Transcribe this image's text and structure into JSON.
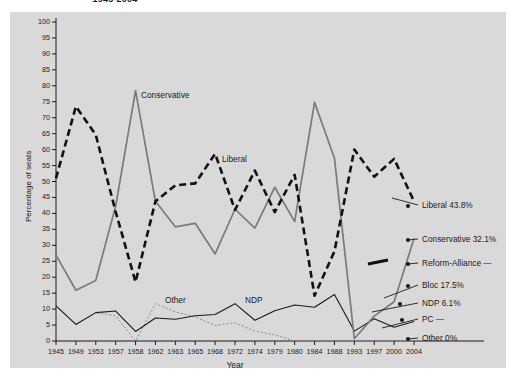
{
  "title": "1945-2004",
  "chart_data": {
    "type": "line",
    "title": "1945-2004",
    "xlabel": "Year",
    "ylabel": "Percentage of seats",
    "ylim": [
      0,
      100
    ],
    "ytick_step": 5,
    "grid": false,
    "legend_position": "right",
    "categories": [
      "1945",
      "1949",
      "1953",
      "1957",
      "1958",
      "1962",
      "1963",
      "1965",
      "1968",
      "1972",
      "1974",
      "1979",
      "1980",
      "1984",
      "1988",
      "1993",
      "1997",
      "2000",
      "2004"
    ],
    "series": [
      {
        "name": "Liberal",
        "style": "dashed-thick-black",
        "color": "#111111",
        "values": [
          51,
          73.5,
          64.6,
          40.5,
          18.5,
          43.8,
          48.8,
          49.4,
          58.7,
          41.1,
          53.4,
          40.4,
          52.1,
          14.2,
          28.1,
          60,
          51.5,
          57.1,
          43.8
        ]
      },
      {
        "name": "Conservative",
        "style": "solid-gray",
        "color": "#7a7a7a",
        "values": [
          26.9,
          15.9,
          19,
          42.3,
          78.5,
          43.8,
          35.8,
          36.9,
          27.3,
          41.3,
          35.4,
          48.2,
          37.4,
          74.8,
          57.3,
          0.7,
          7.8,
          12.3,
          32.1
        ]
      },
      {
        "name": "NDP",
        "style": "solid-thin-black",
        "color": "#1a1a1a",
        "values": [
          11,
          5.2,
          8.9,
          9.4,
          3,
          7.2,
          6.8,
          7.9,
          8.3,
          11.7,
          605,
          9.5,
          11.3,
          10.6,
          14.6,
          3.1,
          7,
          4.3,
          6.1
        ]
      },
      {
        "name": "Other",
        "style": "dotted-thin-gray",
        "color": "#8a8a8a",
        "values": [
          11,
          5.2,
          8.9,
          7.9,
          0,
          11.7,
          9.1,
          7.6,
          4.9,
          5.7,
          3.1,
          1.9,
          0,
          0,
          0,
          0,
          0,
          0,
          0
        ]
      }
    ],
    "annotations": [
      {
        "text": "Conservative",
        "x": 1958
      },
      {
        "text": "Liberal",
        "x": 1968
      },
      {
        "text": "Other",
        "x": 1963
      },
      {
        "text": "NDP",
        "x": 1972
      }
    ],
    "legend_entries": [
      {
        "label": "Liberal 43.8%",
        "value": 43.8
      },
      {
        "label": "Conservative 32.1%",
        "value": 32.1
      },
      {
        "label": "Reform-Alliance —",
        "value": null
      },
      {
        "label": "Bloc 17.5%",
        "value": 17.5
      },
      {
        "label": "NDP 6.1%",
        "value": 6.1
      },
      {
        "label": "PC —",
        "value": null
      },
      {
        "label": "Other 0%",
        "value": 0
      }
    ],
    "ytick_labels": [
      "100",
      "95",
      "90",
      "85",
      "80",
      "75",
      "70",
      "65",
      "60",
      "55",
      "50",
      "45",
      "40",
      "35",
      "30",
      "25",
      "20",
      "15",
      "10",
      "5",
      "0"
    ]
  },
  "axes": {
    "y_title": "Percentage of seats",
    "x_title": "Year"
  },
  "colors": {
    "panel_bg": "#d9d9d9",
    "page_bg": "#ffffff",
    "liberal": "#111111",
    "conservative": "#7a7a7a",
    "ndp": "#1a1a1a",
    "other": "#8a8a8a",
    "axis": "#1a1a1a"
  },
  "yticks": [
    {
      "label": "100"
    },
    {
      "label": "95"
    },
    {
      "label": "90"
    },
    {
      "label": "85"
    },
    {
      "label": "80"
    },
    {
      "label": "75"
    },
    {
      "label": "70"
    },
    {
      "label": "65"
    },
    {
      "label": "60"
    },
    {
      "label": "55"
    },
    {
      "label": "50"
    },
    {
      "label": "45"
    },
    {
      "label": "40"
    },
    {
      "label": "35"
    },
    {
      "label": "30"
    },
    {
      "label": "25"
    },
    {
      "label": "20"
    },
    {
      "label": "15"
    },
    {
      "label": "10"
    },
    {
      "label": "5"
    },
    {
      "label": "0"
    }
  ],
  "xticks": [
    {
      "label": "1945"
    },
    {
      "label": "1949"
    },
    {
      "label": "1953"
    },
    {
      "label": "1957"
    },
    {
      "label": "1958"
    },
    {
      "label": "1962"
    },
    {
      "label": "1963"
    },
    {
      "label": "1965"
    },
    {
      "label": "1968"
    },
    {
      "label": "1972"
    },
    {
      "label": "1974"
    },
    {
      "label": "1979"
    },
    {
      "label": "1980"
    },
    {
      "label": "1984"
    },
    {
      "label": "1988"
    },
    {
      "label": "1993"
    },
    {
      "label": "1997"
    },
    {
      "label": "2000"
    },
    {
      "label": "2004"
    }
  ],
  "annotations": [
    {
      "text": "Conservative"
    },
    {
      "text": "Liberal"
    },
    {
      "text": "Other"
    },
    {
      "text": "NDP"
    }
  ],
  "legend": [
    {
      "label": "Liberal 43.8%"
    },
    {
      "label": "Conservative 32.1%"
    },
    {
      "label": "Reform-Alliance —"
    },
    {
      "label": "Bloc 17.5%"
    },
    {
      "label": "NDP 6.1%"
    },
    {
      "label": "PC —"
    },
    {
      "label": "Other 0%"
    }
  ]
}
